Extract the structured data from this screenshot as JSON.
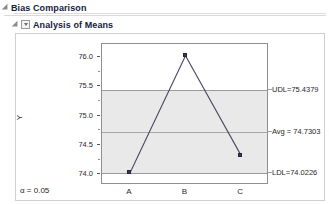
{
  "report": {
    "outline_level1": {
      "title": "Bias Comparison",
      "disclosure_icon": "triangle-down-icon"
    },
    "outline_level2": {
      "title": "Analysis of Means",
      "disclosure_icon": "triangle-down-icon",
      "menu_icon": "chevron-down-icon"
    },
    "alpha_note": "α = 0.05"
  },
  "chart_data": {
    "type": "line",
    "title": "Analysis of Means",
    "xlabel": "Operator",
    "ylabel": "Y",
    "categories": [
      "A",
      "B",
      "C"
    ],
    "values": [
      74.02,
      76.02,
      74.32
    ],
    "series": [
      {
        "name": "Group Mean",
        "values": [
          74.02,
          76.02,
          74.32
        ]
      }
    ],
    "ylim": [
      73.82,
      76.22
    ],
    "yticks": [
      "74.0",
      "74.5",
      "75.0",
      "75.5",
      "76.0"
    ],
    "ytick_values": [
      74.0,
      74.5,
      75.0,
      75.5,
      76.0
    ],
    "grid": false,
    "legend": "none",
    "reference_lines": [
      {
        "key": "udl",
        "label": "UDL=75.4379",
        "value": 75.4379
      },
      {
        "key": "avg",
        "label": "Avg = 74.7303",
        "value": 74.7303
      },
      {
        "key": "ldl",
        "label": "LDL=74.0226",
        "value": 74.0226
      }
    ],
    "annotations": [
      "UDL=75.4379",
      "Avg = 74.7303",
      "LDL=74.0226",
      "α = 0.05"
    ],
    "colors": {
      "marker": "#3a3a55",
      "line": "#4a4a63",
      "band": "#e9e9e9",
      "frame": "#8e8e8e"
    }
  }
}
